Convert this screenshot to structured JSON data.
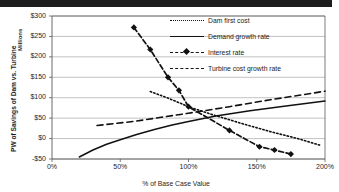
{
  "chart_data": {
    "type": "line",
    "title": "",
    "xlabel": "% of Base Case Value",
    "ylabel": "PW of Savings of Dam vs. Turbine",
    "y_unit_label": "Millions",
    "xlim": [
      0,
      200
    ],
    "ylim": [
      -50,
      300
    ],
    "grid": true,
    "legend_position": "top-right",
    "x_ticks": [
      "0%",
      "50%",
      "100%",
      "150%",
      "200%"
    ],
    "x_tick_values": [
      0,
      50,
      100,
      150,
      200
    ],
    "y_ticks": [
      "$300",
      "$250",
      "$200",
      "$150",
      "$100",
      "$50",
      "$0",
      "-$50"
    ],
    "y_tick_values": [
      300,
      250,
      200,
      150,
      100,
      50,
      0,
      -50
    ],
    "series": [
      {
        "name": "Dam first cost",
        "style": "dotted",
        "marker": "none",
        "x": [
          72,
          85,
          93,
          100,
          118,
          140,
          160,
          180,
          196
        ],
        "y": [
          115,
          99,
          88,
          78,
          58,
          36,
          17,
          0,
          -16
        ]
      },
      {
        "name": "Demand growth rate",
        "style": "solid",
        "marker": "none",
        "x": [
          20,
          30,
          40,
          50,
          62,
          75,
          88,
          100,
          120,
          145,
          170,
          200
        ],
        "y": [
          -45,
          -28,
          -14,
          -3,
          10,
          22,
          33,
          42,
          55,
          68,
          79,
          92
        ]
      },
      {
        "name": "Interest rate",
        "style": "dash",
        "marker": "diamond",
        "x": [
          60,
          72,
          85,
          93,
          100,
          130,
          152,
          163,
          175
        ],
        "y": [
          272,
          218,
          150,
          118,
          78,
          20,
          -20,
          -28,
          -38
        ]
      },
      {
        "name": "Turbine cost growth rate",
        "style": "dashed",
        "marker": "none",
        "x": [
          33,
          60,
          80,
          100,
          130,
          160,
          185,
          200
        ],
        "y": [
          32,
          42,
          52,
          62,
          78,
          95,
          108,
          116
        ]
      }
    ]
  },
  "legend": {
    "items": [
      {
        "label": "Dam first cost",
        "style": "dotted",
        "marker": false
      },
      {
        "label": "Demand growth rate",
        "style": "solid",
        "marker": false
      },
      {
        "label": "Interest rate",
        "style": "dash",
        "marker": true
      },
      {
        "label": "Turbine cost growth rate",
        "style": "dashed",
        "marker": false
      }
    ]
  },
  "colors": {
    "line": "#111111",
    "grid": "#a8a8a8",
    "axis": "#5a5a5a",
    "background": "#ffffff"
  }
}
